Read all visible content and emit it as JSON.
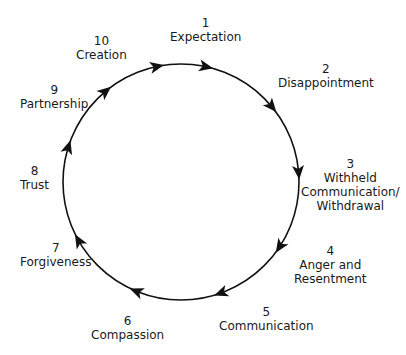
{
  "diagram": {
    "type": "cycle",
    "direction": "clockwise",
    "stages": [
      {
        "num": "1",
        "label": "Expectation"
      },
      {
        "num": "2",
        "label": "Disappointment"
      },
      {
        "num": "3",
        "label": "Withheld\nCommunication/\nWithdrawal"
      },
      {
        "num": "4",
        "label": "Anger and\nResentment"
      },
      {
        "num": "5",
        "label": "Communication"
      },
      {
        "num": "6",
        "label": "Compassion"
      },
      {
        "num": "7",
        "label": "Forgiveness"
      },
      {
        "num": "8",
        "label": "Trust"
      },
      {
        "num": "9",
        "label": "Partnership"
      },
      {
        "num": "10",
        "label": "Creation"
      }
    ],
    "colors": {
      "line": "#111111",
      "text": "#1a1a1a",
      "background": "#ffffff"
    }
  }
}
